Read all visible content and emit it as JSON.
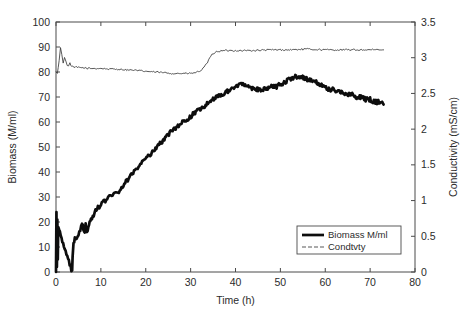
{
  "chart_data": {
    "type": "line",
    "title": "",
    "xlabel": "Time (h)",
    "ylabel": "Biomass (M/ml)",
    "y2label": "Conductivity (mS/cm)",
    "xlim": [
      0,
      80
    ],
    "ylim": [
      0,
      100
    ],
    "y2lim": [
      0,
      3.5
    ],
    "xticks": [
      0,
      10,
      20,
      30,
      40,
      50,
      60,
      70,
      80
    ],
    "xticklabels": [
      "0",
      "10",
      "20",
      "30",
      "40",
      "50",
      "60",
      "70",
      "80"
    ],
    "yticks": [
      0,
      10,
      20,
      30,
      40,
      50,
      60,
      70,
      80,
      90,
      100
    ],
    "yticklabels": [
      "0",
      "10",
      "20",
      "30",
      "40",
      "50",
      "60",
      "70",
      "80",
      "90",
      "100"
    ],
    "y2ticks": [
      0,
      0.5,
      1,
      1.5,
      2,
      2.5,
      3,
      3.5
    ],
    "y2ticklabels": [
      "0",
      "0.5",
      "1",
      "1.5",
      "2",
      "2.5",
      "3",
      "3.5"
    ],
    "grid": false,
    "legend_position": "lower right inside axes",
    "legend_entries": [
      "Biomass M/ml",
      "Condtvty"
    ],
    "series": [
      {
        "name": "Biomass M/ml",
        "axis": "left",
        "units": "M/ml",
        "style": "thick solid black",
        "notes": "Initial vertical noise burst at t=0 spanning 0-24 M/ml; signal flat at 0 until t=3.7; sharp rise then noisy exponential-to-linear growth; plateau near 73-75 from t=40; secondary peak 78 at t=55; decline to 67 at t=73",
        "x": [
          0,
          0.1,
          0.2,
          0.3,
          0.4,
          0.5,
          3.6,
          3.7,
          3.9,
          4.2,
          4.6,
          5.0,
          5.4,
          5.8,
          6.1,
          6.4,
          6.6,
          6.9,
          7.2,
          7.5,
          7.8,
          8.2,
          8.6,
          9.0,
          9.5,
          10.0,
          10.6,
          11.2,
          11.8,
          12.4,
          13.0,
          13.6,
          14.2,
          14.8,
          15.4,
          16.0,
          16.8,
          17.6,
          18.4,
          19.2,
          20.0,
          21.0,
          22.0,
          23.0,
          24.0,
          25.0,
          26.0,
          27.0,
          28.0,
          29.0,
          30.0,
          31.0,
          32.0,
          33.0,
          34.0,
          35.0,
          36.0,
          37.0,
          38.0,
          39.0,
          40.0,
          41.0,
          42.0,
          43.0,
          44.0,
          45.0,
          46.0,
          47.0,
          48.0,
          49.0,
          50.0,
          51.0,
          52.0,
          53.0,
          54.0,
          55.0,
          56.0,
          57.0,
          58.0,
          59.0,
          60.0,
          61.0,
          62.0,
          63.0,
          64.0,
          65.0,
          66.0,
          67.0,
          68.0,
          69.0,
          70.0,
          71.0,
          72.0,
          73.0
        ],
        "y": [
          0,
          24,
          2,
          21,
          5,
          18,
          0,
          6,
          11,
          13,
          14,
          15,
          17,
          20,
          17,
          15,
          19,
          16,
          18,
          20,
          21,
          22,
          24,
          25,
          26,
          27,
          28,
          29,
          30,
          31,
          32,
          31,
          33,
          34,
          36,
          37,
          39,
          41,
          42,
          44,
          45,
          47,
          49,
          51,
          53,
          55,
          57,
          58,
          60,
          61,
          62,
          64,
          65,
          66,
          68,
          69,
          70,
          71,
          72,
          73,
          74,
          75,
          75,
          74,
          73,
          73,
          73,
          73,
          74,
          74,
          75,
          76,
          77,
          78,
          78,
          78,
          77,
          77,
          76,
          75,
          74,
          73,
          73,
          72,
          72,
          71,
          71,
          70,
          70,
          69,
          69,
          68,
          68,
          67
        ]
      },
      {
        "name": "Condtvty",
        "axis": "right",
        "units": "mS/cm",
        "style": "thin solid",
        "notes": "Starts 2.80, sharp spike to 3.15 at t=1, secondary bumps, settles 2.86, slow dip to 2.77 near t=32, rises to 3.06 by t=35, then flat 3.10-3.12 until t=73",
        "x": [
          0,
          0.3,
          0.7,
          1.0,
          1.3,
          1.6,
          1.9,
          2.2,
          2.5,
          2.8,
          3.1,
          3.5,
          4.0,
          4.5,
          5.0,
          6.0,
          7.0,
          8.0,
          10.0,
          12.0,
          14.0,
          16.0,
          18.0,
          20.0,
          22.0,
          24.0,
          26.0,
          28.0,
          30.0,
          31.0,
          32.0,
          33.0,
          34.0,
          34.5,
          35.0,
          36.0,
          38.0,
          40.0,
          44.0,
          48.0,
          52.0,
          56.0,
          60.0,
          64.0,
          68.0,
          70.0,
          73.0
        ],
        "y": [
          2.8,
          2.78,
          2.95,
          3.15,
          3.05,
          2.92,
          3.0,
          2.96,
          2.9,
          2.88,
          2.92,
          2.88,
          2.86,
          2.87,
          2.86,
          2.86,
          2.85,
          2.85,
          2.85,
          2.84,
          2.84,
          2.83,
          2.82,
          2.81,
          2.8,
          2.79,
          2.78,
          2.78,
          2.78,
          2.79,
          2.81,
          2.86,
          2.96,
          3.02,
          3.06,
          3.09,
          3.1,
          3.1,
          3.1,
          3.11,
          3.11,
          3.12,
          3.11,
          3.11,
          3.11,
          3.11,
          3.11
        ]
      }
    ]
  },
  "colors": {
    "biomass": "#0d0d0d",
    "conductivity": "#3a3a3a",
    "axis": "#4a4a4a",
    "background": "#ffffff"
  }
}
